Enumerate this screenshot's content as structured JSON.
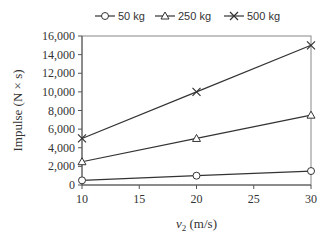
{
  "chart_data": {
    "type": "line",
    "title": "",
    "xlabel": "v2 (m/s)",
    "xlabel_main": "v",
    "xlabel_sub": "2",
    "xlabel_unit": " (m/s)",
    "ylabel": "Impulse (N × s)",
    "x": [
      10,
      20,
      30
    ],
    "xlim": [
      10,
      30
    ],
    "ylim": [
      0,
      16000
    ],
    "xticks": [
      10,
      15,
      20,
      25,
      30
    ],
    "xtick_labels": [
      "10",
      "15",
      "20",
      "25",
      "30"
    ],
    "yticks": [
      0,
      2000,
      4000,
      6000,
      8000,
      10000,
      12000,
      14000,
      16000
    ],
    "ytick_labels": [
      "0",
      "2,000",
      "4,000",
      "6,000",
      "8,000",
      "10,000",
      "12,000",
      "14,000",
      "16,000"
    ],
    "grid": false,
    "legend_position": "top",
    "series": [
      {
        "name": "50 kg",
        "marker": "circle",
        "values": [
          500,
          1000,
          1500
        ]
      },
      {
        "name": "250 kg",
        "marker": "triangle",
        "values": [
          2500,
          5000,
          7500
        ]
      },
      {
        "name": "500 kg",
        "marker": "x",
        "values": [
          5000,
          10000,
          15000
        ]
      }
    ]
  },
  "colors": {
    "line": "#333333",
    "axis": "#555555",
    "border": "#888888"
  }
}
